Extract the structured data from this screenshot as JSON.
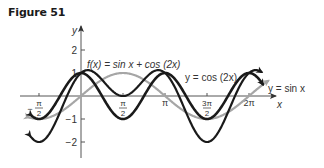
{
  "figure": {
    "title": "Figure 51"
  },
  "chart_data": {
    "type": "line",
    "title": "Figure 51",
    "xlabel": "x",
    "ylabel": "y",
    "xlim": [
      -1.95,
      6.95
    ],
    "ylim": [
      -2.3,
      2.5
    ],
    "grid": false,
    "x_ticks": [
      {
        "value": -1.5708,
        "label": "-π/2"
      },
      {
        "value": 1.5708,
        "label": "π/2"
      },
      {
        "value": 3.1416,
        "label": "π"
      },
      {
        "value": 4.7124,
        "label": "3π/2"
      },
      {
        "value": 6.2832,
        "label": "2π"
      }
    ],
    "y_ticks": [
      {
        "value": 2,
        "label": "2"
      },
      {
        "value": 1,
        "label": "1"
      },
      {
        "value": -1,
        "label": "-1"
      },
      {
        "value": -2,
        "label": "-2"
      }
    ],
    "series": [
      {
        "name": "f(x) = sin x + cos (2x)",
        "expr": "sin(x)+cos(2x)",
        "color": "#1a1a1a",
        "domain": [
          -1.9,
          6.75
        ],
        "width": 2.2,
        "sample_points": [
          [
            -1.5708,
            -2
          ],
          [
            0,
            1
          ],
          [
            0.5236,
            1.5
          ],
          [
            1.5708,
            0
          ],
          [
            2.618,
            1.5
          ],
          [
            3.1416,
            1
          ],
          [
            4.7124,
            -2
          ],
          [
            6.2832,
            1
          ]
        ]
      },
      {
        "name": "y = cos (2x)",
        "expr": "cos(2x)",
        "color": "#1a1a1a",
        "domain": [
          -1.85,
          6.8
        ],
        "width": 2.6,
        "sample_points": [
          [
            -1.5708,
            -1
          ],
          [
            0,
            1
          ],
          [
            1.5708,
            -1
          ],
          [
            3.1416,
            1
          ],
          [
            4.7124,
            -1
          ],
          [
            6.2832,
            1
          ]
        ]
      },
      {
        "name": "y = sin x",
        "expr": "sin(x)",
        "color": "#a6a6a6",
        "domain": [
          -1.95,
          7.0
        ],
        "width": 2.2,
        "sample_points": [
          [
            -1.5708,
            -1
          ],
          [
            0,
            0
          ],
          [
            1.5708,
            1
          ],
          [
            3.1416,
            0
          ],
          [
            4.7124,
            -1
          ],
          [
            6.2832,
            0
          ]
        ]
      }
    ],
    "annotations": [
      {
        "text": "f(x) = sin x + cos (2x)",
        "near_series": "f(x) = sin x + cos (2x)"
      },
      {
        "text": "y = cos (2x)",
        "near_series": "y = cos (2x)"
      },
      {
        "text": "y = sin x",
        "near_series": "y = sin x"
      }
    ]
  },
  "labels": {
    "y_axis": "y",
    "x_axis": "x",
    "f_label": "f(x) = sin x + cos (2x)",
    "cos_label": "y = cos (2x)",
    "sin_label": "y = sin x"
  }
}
